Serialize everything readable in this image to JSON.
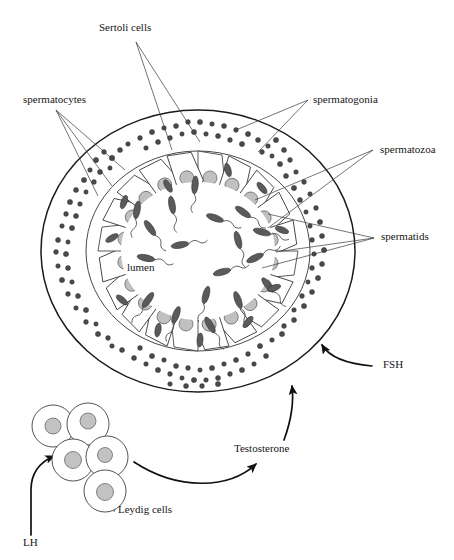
{
  "figure": {
    "background_color": "#ffffff",
    "ink_color": "#1a1a1a"
  },
  "labels": {
    "sertoli_cells": "Sertoli cells",
    "spermatocytes": "spermatocytes",
    "spermatogonia": "spermatogonia",
    "spermatozoa": "spermatozoa",
    "spermatids": "spermatids",
    "lumen": "lumen",
    "fsh": "FSH",
    "testosterone": "Testosterone",
    "leydig_cells": "Leydig cells",
    "lh": "LH"
  },
  "structures": {
    "tubule": {
      "center_x": 198,
      "center_y": 251,
      "outer_radius_x": 157,
      "outer_radius_y": 141,
      "inner_ring_radius_x": 112,
      "inner_ring_radius_y": 100,
      "lumen_radius_x": 78,
      "lumen_radius_y": 70,
      "outline_color": "#1b1b1b"
    },
    "sertoli_cell_count": 20,
    "nucleus_color": "#c0c0c0",
    "germ_cell_dot_color": "#4a4a4a",
    "spermatozoa_count": 18,
    "leydig": {
      "count": 5,
      "cell_radius": 21,
      "nucleus_radius": 8,
      "nucleus_color": "#c2c2c2",
      "positions": [
        {
          "x": 53,
          "y": 426
        },
        {
          "x": 88,
          "y": 424
        },
        {
          "x": 73,
          "y": 460
        },
        {
          "x": 107,
          "y": 457
        },
        {
          "x": 105,
          "y": 491
        }
      ]
    }
  },
  "annotations": {
    "sertoli_cells": {
      "x": 99,
      "y": 31
    },
    "spermatocytes": {
      "x": 23,
      "y": 103
    },
    "spermatogonia": {
      "x": 313,
      "y": 103
    },
    "spermatozoa": {
      "x": 380,
      "y": 153
    },
    "spermatids": {
      "x": 381,
      "y": 240
    },
    "lumen": {
      "x": 127,
      "y": 271
    },
    "fsh": {
      "x": 383,
      "y": 368
    },
    "testosterone": {
      "x": 234,
      "y": 452
    },
    "leydig_cells": {
      "x": 118,
      "y": 513
    },
    "lh": {
      "x": 23,
      "y": 546
    }
  }
}
